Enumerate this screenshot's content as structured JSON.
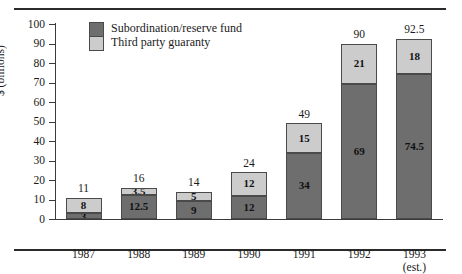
{
  "chart_data": {
    "type": "bar",
    "stacked": true,
    "title": "",
    "xlabel": "",
    "ylabel": "$ (billions)",
    "ylim": [
      0,
      100
    ],
    "ytick_step": 10,
    "yticks": [
      "100",
      "90",
      "80",
      "70",
      "60",
      "50",
      "40",
      "30",
      "20",
      "10",
      "0"
    ],
    "grid": false,
    "legend_position": "top-left-inside",
    "categories": [
      "1987",
      "1988",
      "1989",
      "1990",
      "1991",
      "1992",
      "1993"
    ],
    "category_sublabels": [
      "",
      "",
      "",
      "",
      "",
      "",
      "(est.)"
    ],
    "series": [
      {
        "name": "Subordination/reserve fund",
        "color": "#6e6e6e",
        "values": [
          3,
          12.5,
          9,
          12,
          34,
          69,
          74.5
        ],
        "value_labels": [
          "3",
          "12.5",
          "9",
          "12",
          "34",
          "69",
          "74.5"
        ]
      },
      {
        "name": "Third party guaranty",
        "color": "#cccccc",
        "values": [
          8,
          3.5,
          5,
          12,
          15,
          21,
          18
        ],
        "value_labels": [
          "8",
          "3.5",
          "5",
          "12",
          "15",
          "21",
          "18"
        ]
      }
    ],
    "totals": [
      11,
      16,
      14,
      24,
      49,
      90,
      92.5
    ],
    "total_labels": [
      "11",
      "16",
      "14",
      "24",
      "49",
      "90",
      "92.5"
    ]
  },
  "legend": {
    "items": [
      {
        "label": "Subordination/reserve fund",
        "color": "#6e6e6e"
      },
      {
        "label": "Third party guaranty",
        "color": "#cccccc"
      }
    ]
  },
  "axis": {
    "y_title": "$ (billions)"
  }
}
